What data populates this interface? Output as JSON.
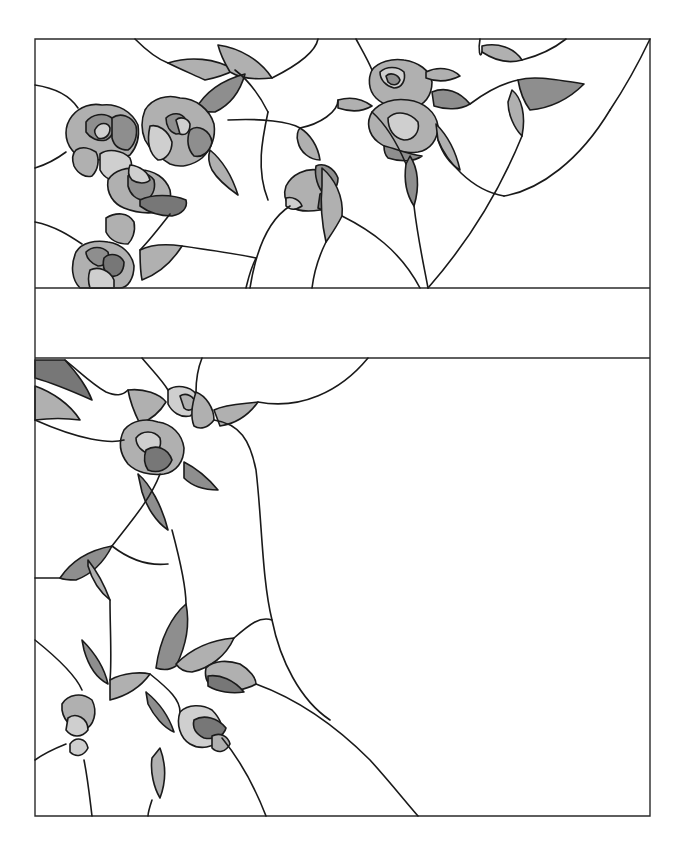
{
  "artwork": {
    "type": "stained-glass-pattern",
    "subject": "roses and leaves",
    "palette": {
      "background": "#ffffff",
      "lead": "#1a1a1a",
      "light": "#cfcfcf",
      "mid": "#b0b0b0",
      "dark": "#8e8e8e",
      "deep": "#777777"
    },
    "frame": {
      "left": 35,
      "right": 650,
      "top": 39,
      "bottom": 816
    },
    "top_panel": {
      "top": 39,
      "bottom": 288
    },
    "divider_band": {
      "top": 288,
      "bottom": 358
    },
    "bottom_panel": {
      "top": 358,
      "bottom": 816
    },
    "pieces": [
      {
        "d": "M168,63 C190,56 215,58 235,70 C225,75 215,78 205,80 C192,74 180,69 168,63 Z",
        "fill": "mid"
      },
      {
        "d": "M218,45 C240,48 260,60 272,78 C255,80 240,78 230,72 C224,62 220,53 218,45 Z",
        "fill": "mid"
      },
      {
        "d": "M195,110 C205,92 222,80 245,74 C240,92 230,105 215,112 C208,112 200,112 195,110 Z",
        "fill": "dark"
      },
      {
        "d": "M72,116 C80,106 92,103 102,105 C118,103 132,112 138,125 C140,138 136,148 130,155 C120,160 108,158 98,160 C88,162 78,158 72,150 C64,140 64,126 72,116 Z",
        "fill": "mid"
      },
      {
        "d": "M86,122 C92,114 104,112 112,118 C116,126 114,136 106,140 C98,142 90,138 86,132 Z",
        "fill": "dark"
      },
      {
        "d": "M96,128 C100,122 108,122 110,128 C110,136 104,140 98,138 C94,134 94,130 96,128 Z",
        "fill": "light"
      },
      {
        "d": "M112,118 C120,112 132,116 136,126 C138,136 134,146 128,150 C120,150 114,146 112,138 Z",
        "fill": "dark"
      },
      {
        "d": "M76,150 C82,146 90,148 96,152 C100,160 98,170 92,176 C86,178 78,174 74,166 C72,160 72,154 76,150 Z",
        "fill": "mid"
      },
      {
        "d": "M100,154 C108,148 122,150 130,158 C134,168 130,178 122,180 C112,182 104,178 100,170 Z",
        "fill": "light"
      },
      {
        "d": "M145,110 C152,98 168,94 180,98 C196,98 210,110 214,124 C216,138 210,150 202,158 C192,166 180,168 170,164 C160,158 150,150 145,140 C141,130 141,120 145,110 Z",
        "fill": "mid"
      },
      {
        "d": "M166,118 C172,112 182,112 186,120 C188,128 184,134 176,134 C170,132 166,126 166,118 Z",
        "fill": "dark"
      },
      {
        "d": "M176,120 C180,116 188,118 190,124 C190,132 186,136 180,134 Z",
        "fill": "light"
      },
      {
        "d": "M190,130 C198,124 210,130 212,142 C210,152 202,158 194,156 C188,150 186,140 190,130 Z",
        "fill": "dark"
      },
      {
        "d": "M150,126 C158,124 168,130 172,142 C172,152 166,160 158,160 C150,154 146,144 150,126 Z",
        "fill": "light"
      },
      {
        "d": "M108,180 C114,170 128,166 140,170 C154,170 166,178 170,190 C172,200 168,208 158,212 C146,214 134,212 124,208 C114,204 106,194 108,180 Z",
        "fill": "mid"
      },
      {
        "d": "M128,176 C136,170 148,172 154,180 C156,190 152,198 144,200 C136,200 130,194 128,186 Z",
        "fill": "dark"
      },
      {
        "d": "M140,200 C152,194 172,194 186,200 C188,208 182,214 172,216 C160,216 148,212 140,206 Z",
        "fill": "deep"
      },
      {
        "d": "M130,165 C140,166 148,172 150,180 C146,184 138,184 132,180 C128,176 128,170 130,165 Z",
        "fill": "light"
      },
      {
        "d": "M210,150 C222,160 232,176 238,195 C228,188 218,180 212,170 C208,162 208,156 210,150 Z",
        "fill": "mid"
      },
      {
        "d": "M106,218 C116,212 128,212 134,222 C136,232 132,240 128,244 C118,244 110,240 106,232 Z",
        "fill": "mid"
      },
      {
        "d": "M76,252 C82,242 96,240 108,242 C122,244 132,254 134,266 C134,278 128,288 120,288 L80,288 C72,280 70,266 76,252 Z",
        "fill": "mid"
      },
      {
        "d": "M86,252 C92,246 102,246 108,252 C110,260 106,266 98,266 C92,264 86,258 86,252 Z",
        "fill": "dark"
      },
      {
        "d": "M104,258 C110,252 120,254 124,262 C124,272 118,278 110,276 C104,272 102,266 104,258 Z",
        "fill": "deep"
      },
      {
        "d": "M90,270 C98,266 110,270 114,280 L114,288 L90,288 C88,282 88,276 90,270 Z",
        "fill": "light"
      },
      {
        "d": "M140,250 C152,244 168,244 182,246 C172,262 158,274 142,280 C140,270 140,260 140,250 Z",
        "fill": "mid"
      },
      {
        "d": "M286,186 C292,174 306,168 318,170 C330,172 336,182 336,194 C336,204 330,210 320,210 C308,212 298,212 290,206 C284,200 284,192 286,186 Z",
        "fill": "mid"
      },
      {
        "d": "M316,166 C324,162 334,168 338,178 C338,188 332,194 324,194 C318,188 314,176 316,166 Z",
        "fill": "dark"
      },
      {
        "d": "M320,194 C328,190 336,196 336,204 C332,210 324,212 318,208 Z",
        "fill": "deep"
      },
      {
        "d": "M286,198 C292,196 300,200 302,206 C296,210 290,210 286,206 Z",
        "fill": "light"
      },
      {
        "d": "M300,128 C310,134 318,146 320,160 C310,160 300,152 298,142 C296,136 298,130 300,128 Z",
        "fill": "mid"
      },
      {
        "d": "M322,168 C334,178 344,196 342,216 C336,228 330,236 326,242 C322,224 320,206 322,186 Z",
        "fill": "mid"
      },
      {
        "d": "M372,70 C378,62 392,58 404,60 C418,62 430,70 432,82 C432,96 424,106 412,108 C398,110 384,106 376,98 C368,90 368,78 372,70 Z",
        "fill": "mid"
      },
      {
        "d": "M380,72 C386,66 398,66 404,72 C406,80 402,88 394,88 C386,86 380,80 380,72 Z",
        "fill": "light"
      },
      {
        "d": "M386,76 C390,72 398,74 400,80 C398,86 392,86 388,82 Z",
        "fill": "dark"
      },
      {
        "d": "M372,112 C380,102 394,98 408,100 C424,102 436,112 438,126 C438,140 430,150 418,152 C404,154 388,150 378,142 C368,134 366,122 372,112 Z",
        "fill": "mid"
      },
      {
        "d": "M388,118 C396,110 410,112 418,122 C420,132 414,140 404,140 C394,138 388,130 388,118 Z",
        "fill": "light"
      },
      {
        "d": "M384,146 C394,148 408,154 422,156 C414,162 400,162 388,158 C384,154 384,150 384,146 Z",
        "fill": "dark"
      },
      {
        "d": "M338,100 C352,96 364,100 372,106 C362,112 350,112 338,108 Z",
        "fill": "mid"
      },
      {
        "d": "M432,92 C446,86 460,92 470,104 C460,110 446,110 434,106 Z",
        "fill": "dark"
      },
      {
        "d": "M426,72 C438,66 452,68 460,76 C448,82 436,82 426,78 Z",
        "fill": "mid"
      },
      {
        "d": "M436,124 C448,136 456,152 460,170 C450,164 442,152 438,140 Z",
        "fill": "mid"
      },
      {
        "d": "M410,156 C418,168 420,186 414,206 C406,194 404,178 406,164 Z",
        "fill": "dark"
      },
      {
        "d": "M482,46 C498,42 514,48 522,60 C508,64 494,60 482,52 Z",
        "fill": "mid"
      },
      {
        "d": "M518,80 C532,76 548,78 584,84 C570,98 552,108 530,110 C524,102 520,92 518,80 Z",
        "fill": "dark"
      },
      {
        "d": "M512,90 C522,98 526,116 522,136 C514,128 508,114 508,102 Z",
        "fill": "mid"
      },
      {
        "d": "M35,360 L65,360 C76,372 86,384 92,400 C74,392 56,384 35,378 Z",
        "fill": "deep"
      },
      {
        "d": "M35,386 C52,392 70,404 80,420 C66,418 50,418 35,420 Z",
        "fill": "mid"
      },
      {
        "d": "M128,390 C144,388 160,394 166,402 C160,412 150,420 140,424 C134,412 130,402 128,390 Z",
        "fill": "mid"
      },
      {
        "d": "M168,390 C176,384 190,386 196,394 C200,404 196,412 190,416 C180,418 172,412 168,404 Z",
        "fill": "light"
      },
      {
        "d": "M180,396 C186,392 194,396 196,404 C194,410 188,412 184,408 Z",
        "fill": "mid"
      },
      {
        "d": "M196,392 C206,396 214,408 214,420 C208,428 200,430 194,426 C190,416 192,404 196,392 Z",
        "fill": "mid"
      },
      {
        "d": "M124,430 C132,420 146,418 158,422 C172,424 182,434 184,448 C184,462 176,472 164,474 C150,476 136,472 128,464 C120,454 118,442 124,430 Z",
        "fill": "mid"
      },
      {
        "d": "M136,438 C142,430 154,430 160,438 C162,446 158,454 150,454 C142,452 136,446 136,438 Z",
        "fill": "light"
      },
      {
        "d": "M146,450 C156,444 168,448 172,460 C168,470 158,474 148,470 C144,464 144,456 146,450 Z",
        "fill": "deep"
      },
      {
        "d": "M214,410 C226,404 242,404 258,402 C248,416 234,424 220,426 Z",
        "fill": "mid"
      },
      {
        "d": "M184,462 C196,468 208,478 218,490 C204,490 192,486 184,478 Z",
        "fill": "dark"
      },
      {
        "d": "M138,474 C150,484 162,506 168,530 C156,522 146,506 142,492 Z",
        "fill": "dark"
      },
      {
        "d": "M60,578 C72,560 90,550 112,546 C104,562 92,574 76,580 C70,580 64,580 60,578 Z",
        "fill": "dark"
      },
      {
        "d": "M88,560 C96,570 104,584 110,600 C100,592 92,580 88,566 Z",
        "fill": "mid"
      },
      {
        "d": "M156,668 C160,638 172,616 186,604 C190,624 186,646 176,666 C170,670 162,670 156,668 Z",
        "fill": "dark"
      },
      {
        "d": "M176,664 C190,650 210,640 234,638 C226,656 210,668 192,672 C186,672 180,670 176,664 Z",
        "fill": "mid"
      },
      {
        "d": "M206,668 C214,660 228,660 240,664 C250,670 256,678 256,684 C246,690 230,692 218,690 C208,686 204,678 206,668 Z",
        "fill": "mid"
      },
      {
        "d": "M208,676 C220,674 234,680 244,692 C232,694 218,692 208,686 Z",
        "fill": "deep"
      },
      {
        "d": "M82,640 C94,652 104,666 108,684 C96,678 88,664 84,650 Z",
        "fill": "dark"
      },
      {
        "d": "M110,680 C124,672 142,672 150,674 C140,688 126,696 110,700 Z",
        "fill": "mid"
      },
      {
        "d": "M62,704 C68,694 82,692 92,700 C98,712 94,726 84,730 C74,730 64,722 62,710 Z",
        "fill": "mid"
      },
      {
        "d": "M68,718 C76,712 88,718 88,730 C82,738 72,738 66,730 Z",
        "fill": "light"
      },
      {
        "d": "M70,744 C76,736 86,738 88,748 C84,756 76,758 70,752 Z",
        "fill": "light"
      },
      {
        "d": "M146,692 C156,700 168,714 174,732 C164,728 154,716 148,704 Z",
        "fill": "dark"
      },
      {
        "d": "M180,712 C188,704 202,704 212,710 C220,718 224,728 222,738 C214,748 200,750 190,744 C180,738 176,724 180,712 Z",
        "fill": "light"
      },
      {
        "d": "M194,720 C204,714 218,718 226,728 C224,736 214,740 204,738 C196,734 192,728 194,720 Z",
        "fill": "deep"
      },
      {
        "d": "M212,736 C220,732 228,736 230,744 C226,752 218,754 212,748 Z",
        "fill": "mid"
      },
      {
        "d": "M160,748 C166,764 166,782 160,798 C154,788 150,772 152,758 Z",
        "fill": "mid"
      }
    ],
    "lead_lines": [
      "M35,39 L650,39 L650,816 L35,816 Z",
      "M35,288 L650,288",
      "M35,358 L650,358",
      "M135,39 C148,52 160,60 168,63",
      "M35,85 C55,88 70,96 78,108",
      "M35,168 C48,164 58,158 66,152",
      "M35,222 C55,226 70,236 82,244",
      "M235,70 C248,80 260,96 268,112",
      "M272,78 C300,64 316,50 318,39",
      "M228,120 C262,118 290,122 300,128",
      "M300,128 C320,124 338,112 338,100",
      "M170,214 C156,232 146,244 140,250",
      "M182,246 C210,250 238,254 256,258",
      "M256,258 C250,270 248,280 246,288",
      "M268,112 C262,140 256,170 268,200",
      "M290,206 C268,220 256,250 250,288",
      "M326,242 C318,258 314,272 312,288",
      "M342,216 C370,230 400,250 420,288",
      "M372,112 C390,128 400,150 406,164",
      "M414,206 C418,240 424,266 428,288",
      "M438,140 C446,160 470,190 504,196",
      "M504,196 C540,190 580,160 610,110",
      "M610,110 C630,80 640,60 650,39",
      "M522,136 C500,190 470,240 428,288",
      "M470,104 C486,92 500,84 518,80",
      "M522,60 C538,56 552,50 566,39",
      "M480,39 C478,50 480,60 482,52",
      "M356,39 C362,50 368,60 372,70",
      "M35,420 C80,440 110,444 124,440",
      "M65,360 C80,372 92,384 106,392 C116,396 122,396 128,390",
      "M142,358 C152,370 162,380 168,390",
      "M202,358 C198,368 196,378 196,392",
      "M214,420 C240,424 250,440 256,470 C262,520 262,580 272,620 C280,660 300,700 330,720",
      "M368,358 C340,392 300,410 258,402",
      "M160,474 C150,500 132,520 112,546",
      "M35,578 C48,578 56,578 60,578",
      "M172,530 C180,560 186,590 186,604",
      "M112,546 C130,560 150,566 168,564",
      "M110,600 C110,630 112,660 110,680",
      "M35,640 C60,660 76,676 82,690",
      "M35,760 C46,752 56,748 66,744",
      "M234,638 C250,624 260,616 272,620",
      "M256,684 C300,700 340,730 370,760 C390,782 404,800 418,816",
      "M222,738 C240,760 256,790 266,816",
      "M84,760 C88,780 90,800 92,816",
      "M152,800 C150,806 148,812 148,816",
      "M150,674 C170,690 180,700 180,712"
    ]
  }
}
